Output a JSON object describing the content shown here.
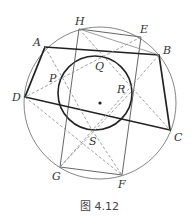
{
  "figure": {
    "caption": "图 4.12",
    "colors": {
      "stroke": "#333333",
      "dashed": "#888888",
      "circle": "#777777"
    },
    "outer_circle": {
      "cx": 100,
      "cy": 103,
      "r": 76
    },
    "inner_circle": {
      "cx": 95,
      "cy": 93,
      "r": 37
    },
    "center_dot": {
      "cx": 100,
      "cy": 103
    },
    "points": {
      "A": {
        "x": 45,
        "y": 47,
        "label": "A"
      },
      "B": {
        "x": 159,
        "y": 55,
        "label": "B"
      },
      "C": {
        "x": 170,
        "y": 130,
        "label": "C"
      },
      "D": {
        "x": 25,
        "y": 97,
        "label": "D"
      },
      "E": {
        "x": 141,
        "y": 37,
        "label": "E"
      },
      "F": {
        "x": 122,
        "y": 175,
        "label": "F"
      },
      "G": {
        "x": 60,
        "y": 167,
        "label": "G"
      },
      "H": {
        "x": 79,
        "y": 29,
        "label": "H"
      },
      "P": {
        "x": 58,
        "y": 80,
        "label": "P"
      },
      "Q": {
        "x": 99,
        "y": 57,
        "label": "Q"
      },
      "R": {
        "x": 131,
        "y": 92,
        "label": "R"
      },
      "S": {
        "x": 92,
        "y": 130,
        "label": "S"
      }
    }
  }
}
